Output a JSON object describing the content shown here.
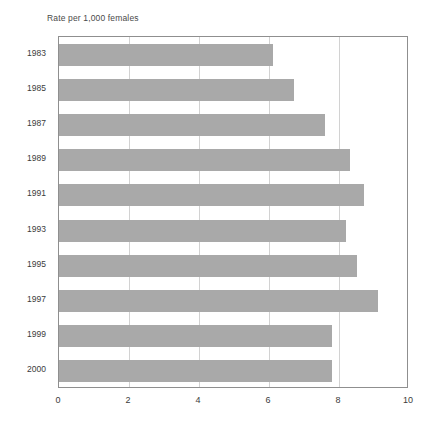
{
  "chart_data": {
    "type": "bar",
    "orientation": "horizontal",
    "title": "Rate per 1,000 females",
    "xlabel": "",
    "ylabel": "",
    "categories": [
      "1983",
      "1985",
      "1987",
      "1989",
      "1991",
      "1993",
      "1995",
      "1997",
      "1999",
      "2000"
    ],
    "values": [
      6.1,
      6.7,
      7.6,
      8.3,
      8.7,
      8.2,
      8.5,
      9.1,
      7.8,
      7.8
    ],
    "xlim": [
      0,
      10
    ],
    "ylim": null,
    "xticks": [
      0,
      2,
      4,
      6,
      8,
      10
    ],
    "xtick_labels": [
      "0",
      "2",
      "4",
      "6",
      "8",
      "10"
    ],
    "grid": "vertical",
    "legend": null,
    "bar_color": "#a9a9a9",
    "gridline_color": "#d2d2d2",
    "frame_color": "#8f8f8f",
    "background_color": "#ffffff",
    "series": [
      {
        "name": "Rate per 1,000 females",
        "values": [
          6.1,
          6.7,
          7.6,
          8.3,
          8.7,
          8.2,
          8.5,
          9.1,
          7.8,
          7.8
        ]
      }
    ]
  },
  "figure": {
    "caption": "Rate per 1,000 females"
  }
}
